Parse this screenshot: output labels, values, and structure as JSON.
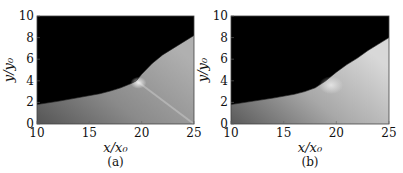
{
  "chart_data": [
    {
      "type": "heatmap",
      "panel_label": "(a)",
      "title": "",
      "xlabel": "x/x₀",
      "ylabel": "y/y₀",
      "xlim": [
        10,
        25
      ],
      "ylim": [
        0,
        10
      ],
      "xticks": [
        10,
        15,
        20,
        25
      ],
      "yticks": [
        0,
        2,
        4,
        6,
        8,
        10
      ],
      "colormap": "grayscale",
      "grid": false,
      "boundary": {
        "x": [
          10,
          12,
          14,
          16,
          17,
          18,
          19,
          19.5,
          20,
          21,
          22,
          23,
          24,
          25
        ],
        "y": [
          1.8,
          2.1,
          2.45,
          2.8,
          3.05,
          3.35,
          3.75,
          4.0,
          4.6,
          5.6,
          6.4,
          7.0,
          7.6,
          8.2
        ]
      },
      "features": {
        "ridge_from": [
          19.5,
          4.0
        ],
        "ridge_to": [
          25,
          0
        ],
        "bright_spot": [
          19.5,
          4.0
        ]
      }
    },
    {
      "type": "heatmap",
      "panel_label": "(b)",
      "title": "",
      "xlabel": "x/x₀",
      "ylabel": "y/y₀",
      "xlim": [
        10,
        25
      ],
      "ylim": [
        0,
        10
      ],
      "xticks": [
        10,
        15,
        20,
        25
      ],
      "yticks": [
        0,
        2,
        4,
        6,
        8,
        10
      ],
      "colormap": "grayscale",
      "grid": false,
      "boundary": {
        "x": [
          10,
          12,
          14,
          16,
          17,
          18,
          19,
          20,
          21,
          22,
          23,
          24,
          25
        ],
        "y": [
          1.8,
          2.1,
          2.4,
          2.75,
          3.0,
          3.35,
          4.0,
          4.8,
          5.5,
          6.1,
          6.8,
          7.4,
          8.0
        ]
      }
    }
  ]
}
